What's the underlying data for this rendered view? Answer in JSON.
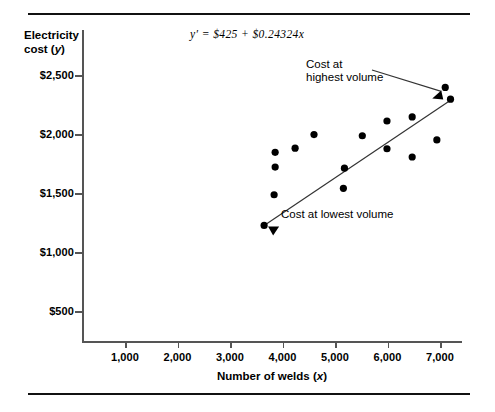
{
  "figure": {
    "equation": "y′  =  $425  +  $0.24324x",
    "y_axis_title": "Electricity cost (y)",
    "x_axis_title": "Number of welds (x)",
    "annotation_high": "Cost at\nhighest volume",
    "annotation_low": "Cost at lowest volume",
    "point_color": "#000000",
    "line_color": "#333333",
    "axis_color": "#555555",
    "rule_color": "#111111"
  },
  "chart_data": {
    "type": "scatter",
    "title": "",
    "xlabel": "Number of welds (x)",
    "ylabel": "Electricity cost (y)",
    "xlim": [
      0,
      7800
    ],
    "ylim": [
      0,
      2750
    ],
    "grid": false,
    "legend": "none",
    "xticks": [
      1000,
      2000,
      3000,
      4000,
      5000,
      6000,
      7000
    ],
    "xticklabels": [
      "1,000",
      "2,000",
      "3,000",
      "4,000",
      "5,000",
      "6,000",
      "7,000"
    ],
    "yticks": [
      500,
      1000,
      1500,
      2000,
      2500
    ],
    "yticklabels": [
      "$500",
      "$1,000",
      "$1,500",
      "$2,000",
      "$2,500"
    ],
    "points": [
      {
        "x": 3650,
        "y": 1225,
        "label": "lowest volume"
      },
      {
        "x": 3840,
        "y": 1485
      },
      {
        "x": 3860,
        "y": 1720
      },
      {
        "x": 3860,
        "y": 1845
      },
      {
        "x": 4240,
        "y": 1880
      },
      {
        "x": 4600,
        "y": 1995
      },
      {
        "x": 5180,
        "y": 1710
      },
      {
        "x": 5160,
        "y": 1540
      },
      {
        "x": 5520,
        "y": 1985
      },
      {
        "x": 5990,
        "y": 2110
      },
      {
        "x": 6470,
        "y": 2145
      },
      {
        "x": 5990,
        "y": 1875
      },
      {
        "x": 6470,
        "y": 1805
      },
      {
        "x": 6940,
        "y": 1950
      },
      {
        "x": 7100,
        "y": 2395
      },
      {
        "x": 7200,
        "y": 2295,
        "label": "highest volume"
      }
    ],
    "regression_line": {
      "equation": "y′ = $425 + $0.24324x",
      "intercept": 425,
      "slope": 0.24324,
      "x_start": 3650,
      "y_start": 1225,
      "x_end": 7250,
      "y_end": 2300
    },
    "annotations": [
      {
        "text": "Cost at highest volume",
        "points_to": {
          "x": 7100,
          "y": 2395
        }
      },
      {
        "text": "Cost at lowest volume",
        "points_to": {
          "x": 3650,
          "y": 1225
        }
      }
    ]
  }
}
